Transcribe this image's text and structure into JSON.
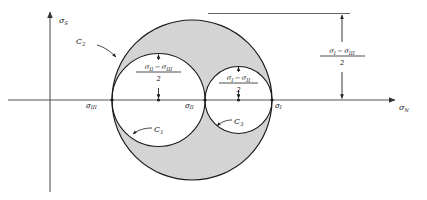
{
  "figure": {
    "type": "mohr-circle-3d",
    "background": "#ffffff",
    "shade_color": "#d4d4d4",
    "stroke_color": "#1a1a1a",
    "axis_color": "#555555"
  },
  "axes": {
    "vertical": {
      "label": "σ",
      "subscript": "S",
      "name": "shear-stress-axis"
    },
    "horizontal": {
      "label": "σ",
      "subscript": "N",
      "name": "normal-stress-axis"
    }
  },
  "points": [
    {
      "id": "sigma-3",
      "label": "σ",
      "subscript": "III",
      "x": 112
    },
    {
      "id": "sigma-2",
      "label": "σ",
      "subscript": "II",
      "x": 205
    },
    {
      "id": "sigma-1",
      "label": "σ",
      "subscript": "I",
      "x": 272
    }
  ],
  "circles": [
    {
      "id": "C1",
      "label": "C",
      "subscript": "1",
      "center_x": 158.5,
      "radius": 46.5,
      "from": "σIII",
      "to": "σII"
    },
    {
      "id": "C2",
      "label": "C",
      "subscript": "2",
      "center_x": 192.0,
      "radius": 80.0,
      "from": "σIII",
      "to": "σI"
    },
    {
      "id": "C3",
      "label": "C",
      "subscript": "3",
      "center_x": 238.5,
      "radius": 33.5,
      "from": "σII",
      "to": "σI"
    }
  ],
  "dimensions": [
    {
      "id": "dim-c1",
      "numerator_left": "σ",
      "numerator_left_sub": "II",
      "operator": "−",
      "numerator_right": "σ",
      "numerator_right_sub": "III",
      "denominator": "2",
      "arrow_x": 158.5,
      "top_y": 53,
      "bottom_y": 100
    },
    {
      "id": "dim-c3",
      "numerator_left": "σ",
      "numerator_left_sub": "I",
      "operator": "−",
      "numerator_right": "σ",
      "numerator_right_sub": "II",
      "denominator": "2",
      "arrow_x": 238.5,
      "top_y": 66,
      "bottom_y": 100
    },
    {
      "id": "dim-c2",
      "numerator_left": "σ",
      "numerator_left_sub": "I",
      "operator": "−",
      "numerator_right": "σ",
      "numerator_right_sub": "III",
      "denominator": "2",
      "arrow_x": 342,
      "top_y": 14,
      "bottom_y": 100
    }
  ],
  "reference_line": {
    "id": "top-tangent-line",
    "x1": 208,
    "x2": 350,
    "y": 13.5
  }
}
